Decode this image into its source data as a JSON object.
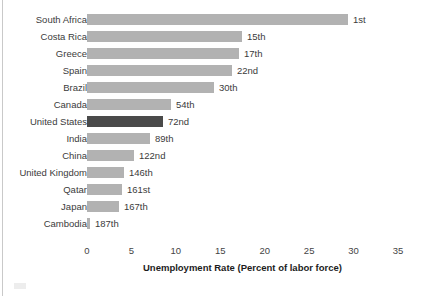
{
  "chart_data": {
    "type": "bar",
    "orientation": "horizontal",
    "title": "",
    "xlabel": "Unemployment Rate (Percent of labor force)",
    "ylabel": "",
    "xlim": [
      0,
      35
    ],
    "xticks": [
      0,
      5,
      10,
      15,
      20,
      25,
      30,
      35
    ],
    "xtick_labels": [
      "0",
      "5",
      "10",
      "15",
      "20",
      "25",
      "30",
      "35"
    ],
    "grid": false,
    "legend": null,
    "categories": [
      "South Africa",
      "Costa Rica",
      "Greece",
      "Spain",
      "Brazil",
      "Canada",
      "United States",
      "India",
      "China",
      "United Kingdom",
      "Qatar",
      "Japan",
      "Cambodia"
    ],
    "values": [
      29.4,
      17.4,
      17.1,
      16.3,
      14.3,
      9.5,
      8.5,
      7.1,
      5.3,
      4.2,
      3.9,
      3.6,
      0.3
    ],
    "bar_labels": [
      "1st",
      "15th",
      "17th",
      "22nd",
      "30th",
      "54th",
      "72nd",
      "89th",
      "122nd",
      "146th",
      "161st",
      "167th",
      "187th"
    ],
    "highlight_category": "United States",
    "colors": {
      "bar": "#b2b2b2",
      "bar_highlight": "#4a4a4a",
      "text": "#3b3b3b",
      "axis_text": "#444444",
      "title_text": "#1c1c1c",
      "background": "#ffffff",
      "frame": "#c9c9c9"
    }
  }
}
